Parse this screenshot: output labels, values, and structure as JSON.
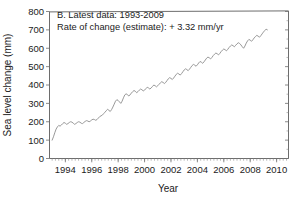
{
  "chart_data": {
    "type": "line",
    "title": "",
    "panel_label": "B. Latest data: 1993-2009",
    "annotation": "Rate of change (estimate): + 3.32 mm/yr",
    "xlabel": "Year",
    "ylabel": "Sea level change (mm)",
    "xlim": [
      1992.8,
      2010.9
    ],
    "ylim": [
      0,
      800
    ],
    "yticks": [
      0,
      100,
      200,
      300,
      400,
      500,
      600,
      700,
      800
    ],
    "ytick_labels": [
      "0",
      "100",
      "200",
      "300",
      "400",
      "500",
      "600",
      "700",
      "800"
    ],
    "xticks": [
      1994,
      1996,
      1998,
      2000,
      2002,
      2004,
      2006,
      2008,
      2010
    ],
    "xtick_labels": [
      "1994",
      "1996",
      "1998",
      "2000",
      "2002",
      "2004",
      "2006",
      "2008",
      "2010"
    ],
    "x_minor_interval": 0.25,
    "y_minor_interval": 50,
    "grid": false,
    "legend": "none",
    "line_color": "#8d8d8d",
    "axis_color": "#6d6d6d",
    "series": [
      {
        "name": "Sea level change",
        "x": [
          1993.0,
          1993.1,
          1993.2,
          1993.3,
          1993.4,
          1993.5,
          1993.6,
          1993.7,
          1993.8,
          1993.9,
          1994.0,
          1994.1,
          1994.2,
          1994.3,
          1994.4,
          1994.5,
          1994.6,
          1994.7,
          1994.8,
          1994.9,
          1995.0,
          1995.1,
          1995.2,
          1995.3,
          1995.4,
          1995.5,
          1995.6,
          1995.7,
          1995.8,
          1995.9,
          1996.0,
          1996.1,
          1996.2,
          1996.3,
          1996.4,
          1996.5,
          1996.6,
          1996.7,
          1996.8,
          1996.9,
          1997.0,
          1997.1,
          1997.2,
          1997.3,
          1997.4,
          1997.5,
          1997.6,
          1997.7,
          1997.8,
          1997.9,
          1998.0,
          1998.1,
          1998.2,
          1998.3,
          1998.4,
          1998.5,
          1998.6,
          1998.7,
          1998.8,
          1998.9,
          1999.0,
          1999.1,
          1999.2,
          1999.3,
          1999.4,
          1999.5,
          1999.6,
          1999.7,
          1999.8,
          1999.9,
          2000.0,
          2000.1,
          2000.2,
          2000.3,
          2000.4,
          2000.5,
          2000.6,
          2000.7,
          2000.8,
          2000.9,
          2001.0,
          2001.1,
          2001.2,
          2001.3,
          2001.4,
          2001.5,
          2001.6,
          2001.7,
          2001.8,
          2001.9,
          2002.0,
          2002.1,
          2002.2,
          2002.3,
          2002.4,
          2002.5,
          2002.6,
          2002.7,
          2002.8,
          2002.9,
          2003.0,
          2003.1,
          2003.2,
          2003.3,
          2003.4,
          2003.5,
          2003.6,
          2003.7,
          2003.8,
          2003.9,
          2004.0,
          2004.1,
          2004.2,
          2004.3,
          2004.4,
          2004.5,
          2004.6,
          2004.7,
          2004.8,
          2004.9,
          2005.0,
          2005.1,
          2005.2,
          2005.3,
          2005.4,
          2005.5,
          2005.6,
          2005.7,
          2005.8,
          2005.9,
          2006.0,
          2006.1,
          2006.2,
          2006.3,
          2006.4,
          2006.5,
          2006.6,
          2006.7,
          2006.8,
          2006.9,
          2007.0,
          2007.1,
          2007.2,
          2007.3,
          2007.4,
          2007.5,
          2007.6,
          2007.7,
          2007.8,
          2007.9,
          2008.0,
          2008.1,
          2008.2,
          2008.3,
          2008.4,
          2008.5,
          2008.6,
          2008.7,
          2008.8,
          2008.9,
          2009.0,
          2009.1,
          2009.2,
          2009.3
        ],
        "y": [
          100,
          118,
          140,
          160,
          172,
          180,
          176,
          182,
          190,
          196,
          192,
          186,
          190,
          196,
          200,
          198,
          192,
          186,
          190,
          196,
          200,
          198,
          192,
          190,
          196,
          202,
          206,
          204,
          200,
          204,
          210,
          214,
          212,
          208,
          212,
          220,
          228,
          232,
          236,
          244,
          252,
          260,
          268,
          262,
          256,
          266,
          280,
          296,
          312,
          320,
          316,
          308,
          300,
          312,
          330,
          346,
          352,
          348,
          340,
          346,
          356,
          364,
          370,
          366,
          358,
          364,
          372,
          378,
          374,
          368,
          372,
          380,
          388,
          384,
          378,
          384,
          392,
          400,
          396,
          390,
          396,
          404,
          412,
          418,
          414,
          408,
          414,
          424,
          434,
          440,
          436,
          430,
          438,
          448,
          458,
          464,
          460,
          454,
          462,
          472,
          482,
          488,
          484,
          478,
          486,
          496,
          506,
          512,
          508,
          502,
          510,
          520,
          528,
          524,
          518,
          526,
          536,
          546,
          552,
          548,
          542,
          550,
          560,
          568,
          574,
          570,
          564,
          572,
          582,
          590,
          596,
          592,
          586,
          594,
          604,
          612,
          618,
          614,
          608,
          616,
          624,
          630,
          626,
          618,
          608,
          600,
          612,
          628,
          640,
          648,
          644,
          638,
          646,
          656,
          664,
          670,
          666,
          660,
          668,
          678,
          688,
          696,
          704,
          700
        ]
      }
    ]
  },
  "figure": {
    "panel_letter": "B."
  }
}
